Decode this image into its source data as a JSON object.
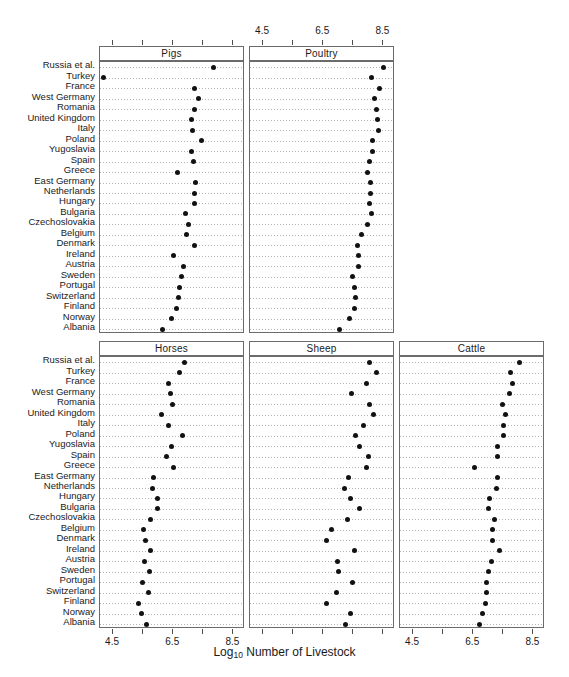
{
  "figure": {
    "xaxis_title_main": "Log",
    "xaxis_title_sub": "10",
    "xaxis_title_rest": " Number of Livestock",
    "tick_values": [
      "4.5",
      "5.5",
      "6.5",
      "7.5",
      "8.5"
    ],
    "labeled_ticks": [
      "4.5",
      "6.5",
      "8.5"
    ],
    "countries": [
      "Russia et al.",
      "Turkey",
      "France",
      "West Germany",
      "Romania",
      "United Kingdom",
      "Italy",
      "Poland",
      "Yugoslavia",
      "Spain",
      "Greece",
      "East Germany",
      "Netherlands",
      "Hungary",
      "Bulgaria",
      "Czechoslovakia",
      "Belgium",
      "Denmark",
      "Ireland",
      "Austria",
      "Sweden",
      "Portugal",
      "Switzerland",
      "Finland",
      "Norway",
      "Albania"
    ]
  },
  "chart_data": {
    "type": "scatter",
    "title": "",
    "xlabel": "Log10 Number of Livestock",
    "ylabel": "",
    "xlim": [
      4.1,
      8.85
    ],
    "xticks": [
      4.5,
      5.5,
      6.5,
      7.5,
      8.5
    ],
    "grid": true,
    "legend": "none",
    "layout": "trellis 2 rows x 3 columns (row 1: Pigs, Poultry; row 2: Horses, Sheep, Cattle)",
    "categories": [
      "Russia et al.",
      "Turkey",
      "France",
      "West Germany",
      "Romania",
      "United Kingdom",
      "Italy",
      "Poland",
      "Yugoslavia",
      "Spain",
      "Greece",
      "East Germany",
      "Netherlands",
      "Hungary",
      "Bulgaria",
      "Czechoslovakia",
      "Belgium",
      "Denmark",
      "Ireland",
      "Austria",
      "Sweden",
      "Portugal",
      "Switzerland",
      "Finland",
      "Norway",
      "Albania"
    ],
    "panels": [
      {
        "name": "Pigs",
        "row": 0,
        "col": 0,
        "values": [
          7.83,
          4.18,
          7.2,
          7.34,
          7.2,
          7.11,
          7.13,
          7.45,
          7.12,
          7.18,
          6.65,
          7.23,
          7.22,
          7.19,
          6.9,
          7.01,
          6.94,
          7.22,
          6.51,
          6.84,
          6.76,
          6.7,
          6.68,
          6.62,
          6.45,
          6.14
        ]
      },
      {
        "name": "Poultry",
        "row": 0,
        "col": 1,
        "values": [
          8.5,
          8.11,
          8.36,
          8.21,
          8.27,
          8.31,
          8.33,
          8.13,
          8.13,
          8.04,
          7.96,
          8.07,
          8.06,
          8.04,
          8.09,
          7.96,
          7.77,
          7.64,
          7.67,
          7.67,
          7.46,
          7.54,
          7.56,
          7.54,
          7.36,
          7.05
        ]
      },
      {
        "name": "Horses",
        "row": 1,
        "col": 0,
        "values": [
          6.86,
          6.72,
          6.33,
          6.41,
          6.48,
          6.1,
          6.33,
          6.82,
          6.44,
          6.28,
          6.52,
          5.86,
          5.8,
          5.99,
          5.98,
          5.74,
          5.5,
          5.58,
          5.76,
          5.56,
          5.7,
          5.49,
          5.68,
          5.33,
          5.43,
          5.62
        ]
      },
      {
        "name": "Sheep",
        "row": 1,
        "col": 1,
        "values": [
          8.04,
          8.26,
          7.93,
          7.44,
          8.02,
          8.16,
          7.84,
          7.57,
          7.7,
          7.99,
          7.92,
          7.33,
          7.21,
          7.42,
          7.72,
          7.3,
          6.78,
          6.6,
          7.53,
          6.98,
          7.0,
          7.48,
          6.95,
          6.6,
          7.39,
          7.23
        ]
      },
      {
        "name": "Cattle",
        "row": 1,
        "col": 2,
        "values": [
          8.04,
          7.73,
          7.79,
          7.72,
          7.47,
          7.56,
          7.49,
          7.5,
          7.32,
          7.31,
          6.55,
          7.31,
          7.26,
          7.04,
          7.01,
          7.22,
          7.15,
          7.14,
          7.36,
          7.09,
          7.02,
          6.95,
          6.95,
          6.9,
          6.81,
          6.72
        ]
      }
    ]
  }
}
